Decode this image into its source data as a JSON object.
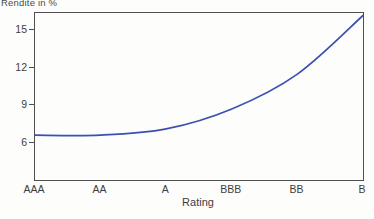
{
  "chart_data": {
    "type": "line",
    "title": "Rendite in %",
    "xlabel": "Rating",
    "ylabel": "Rendite in %",
    "categories": [
      "AAA",
      "AA",
      "A",
      "BBB",
      "BB",
      "B"
    ],
    "values": [
      6.6,
      6.6,
      7.1,
      8.7,
      11.5,
      16.2
    ],
    "yticks": [
      6,
      9,
      12,
      15
    ],
    "ylim": [
      3,
      16.4
    ],
    "grid": false,
    "legend": "none",
    "line_color": "#3a50b2",
    "axis_color": "#4f4f4f",
    "text_color": "#3d3d3d",
    "background_color": "#fdfdfc"
  }
}
